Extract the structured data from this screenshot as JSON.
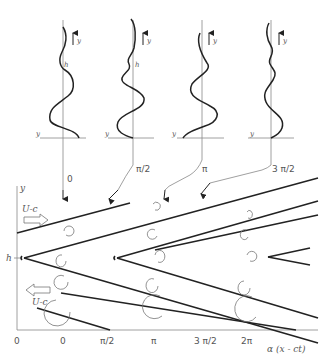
{
  "profiles": [
    {
      "phase_label": "0",
      "height_label": "h",
      "y_label": "y"
    },
    {
      "phase_label": "π/2",
      "height_label": "h",
      "y_label": "y"
    },
    {
      "phase_label": "π",
      "height_label": "h",
      "y_label": "y"
    },
    {
      "phase_label": "3 π/2",
      "height_label": "h",
      "y_label": "y"
    }
  ],
  "bottom_panel": {
    "y_axis_label": "y",
    "h_label": "h",
    "x_axis_label": "α (x - ct)",
    "x_ticks": [
      "0",
      "0",
      "π/2",
      "π",
      "3 π/2",
      "2π"
    ],
    "upper_flow_label": "U-c",
    "lower_flow_label": "U-c"
  }
}
